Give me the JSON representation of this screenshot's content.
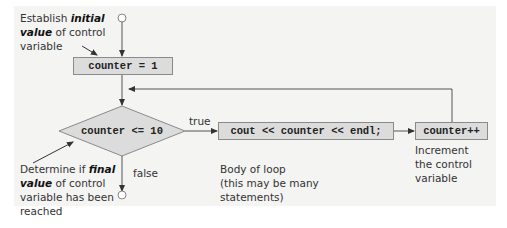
{
  "diagram": {
    "type": "flowchart",
    "title": "",
    "nodes": {
      "start": {
        "shape": "circle",
        "role": "entry"
      },
      "init": {
        "shape": "rect",
        "label": "counter = 1"
      },
      "condition": {
        "shape": "diamond",
        "label": "counter <= 10"
      },
      "body": {
        "shape": "rect",
        "label": "cout << counter << endl;"
      },
      "increment": {
        "shape": "rect",
        "label": "counter++"
      },
      "end": {
        "shape": "circle",
        "role": "exit"
      }
    },
    "edges": [
      {
        "from": "start",
        "to": "init",
        "label": ""
      },
      {
        "from": "init",
        "to": "condition",
        "label": ""
      },
      {
        "from": "condition",
        "to": "body",
        "label": "true"
      },
      {
        "from": "body",
        "to": "increment",
        "label": ""
      },
      {
        "from": "increment",
        "to": "condition",
        "label": ""
      },
      {
        "from": "condition",
        "to": "end",
        "label": "false"
      }
    ],
    "edge_labels": {
      "true": "true",
      "false": "false"
    },
    "annotations": {
      "initial": {
        "line1_pre": "Establish ",
        "line1_em": "initial",
        "line2_em": "value",
        "line2_post": " of control",
        "line3": "variable"
      },
      "final": {
        "line1_pre": "Determine if ",
        "line1_em": "final",
        "line2_em": "value",
        "line2_post": " of control",
        "line3": "variable has been",
        "line4": "reached"
      },
      "body": {
        "line1": "Body of loop",
        "line2": "(this may be many",
        "line3": "statements)"
      },
      "increment": {
        "line1": "Increment",
        "line2": "the control",
        "line3": "variable"
      }
    },
    "colors": {
      "panel_background": "#f4f4f3",
      "box_fill": "#dcdcdc",
      "box_border": "#8a8a8a",
      "line": "#555555"
    }
  }
}
